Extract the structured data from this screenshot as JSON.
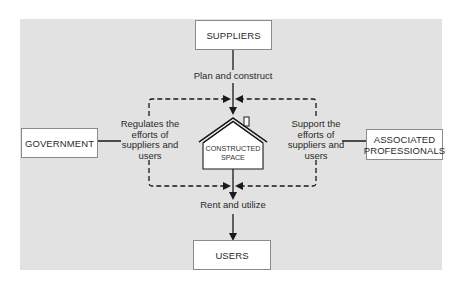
{
  "diagram": {
    "nodes": {
      "suppliers": "SUPPLIERS",
      "government": "GOVERNMENT",
      "associated_professionals_line1": "ASSOCIATED",
      "associated_professionals_line2": "PROFESSIONALS",
      "constructed_space_line1": "CONSTRUCTED",
      "constructed_space_line2": "SPACE",
      "users": "USERS"
    },
    "edge_labels": {
      "plan_construct": "Plan and construct",
      "rent_utilize": "Rent and utilize",
      "regulates_line1": "Regulates the",
      "regulates_line2": "efforts of",
      "regulates_line3": "suppliers and",
      "regulates_line4": "users",
      "support_line1": "Support the",
      "support_line2": "efforts of",
      "support_line3": "suppliers and",
      "support_line4": "users"
    },
    "edges": [
      {
        "from": "SUPPLIERS",
        "to": "CONSTRUCTED SPACE",
        "label": "Plan and construct",
        "style": "solid"
      },
      {
        "from": "CONSTRUCTED SPACE",
        "to": "USERS",
        "label": "Rent and utilize",
        "style": "solid"
      },
      {
        "from": "GOVERNMENT",
        "to": "CONSTRUCTED SPACE",
        "label": "Regulates the efforts of suppliers and users",
        "style": "dashed"
      },
      {
        "from": "ASSOCIATED PROFESSIONALS",
        "to": "CONSTRUCTED SPACE",
        "label": "Support the efforts of suppliers and users",
        "style": "dashed"
      }
    ],
    "colors": {
      "background": "#e2e2e2",
      "box_fill": "#ffffff",
      "line": "#1a1a1a"
    }
  }
}
